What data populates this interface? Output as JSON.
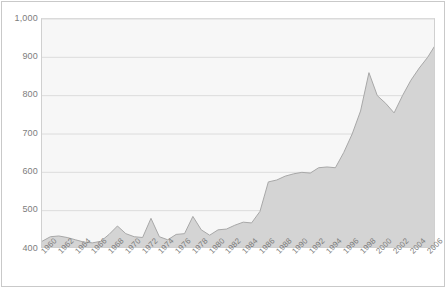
{
  "chart_data": {
    "type": "area",
    "title": "",
    "subtitle": "",
    "xlabel": "",
    "ylabel": "",
    "ylim": [
      400,
      1000
    ],
    "xlim": [
      1960,
      2007
    ],
    "grid": true,
    "legend": "none",
    "y_ticks": [
      "400",
      "500",
      "600",
      "700",
      "800",
      "900",
      "1,000"
    ],
    "y_tick_values": [
      400,
      500,
      600,
      700,
      800,
      900,
      1000
    ],
    "x_ticks": [
      "1960",
      "1962",
      "1964",
      "1966",
      "1968",
      "1970",
      "1972",
      "1974",
      "1976",
      "1978",
      "1980",
      "1982",
      "1984",
      "1986",
      "1988",
      "1990",
      "1992",
      "1994",
      "1996",
      "1998",
      "2000",
      "2002",
      "2004",
      "2006"
    ],
    "x_tick_values": [
      1960,
      1962,
      1964,
      1966,
      1968,
      1970,
      1972,
      1974,
      1976,
      1978,
      1980,
      1982,
      1984,
      1986,
      1988,
      1990,
      1992,
      1994,
      1996,
      1998,
      2000,
      2002,
      2004,
      2006
    ],
    "x": [
      1960,
      1961,
      1962,
      1963,
      1964,
      1965,
      1966,
      1967,
      1968,
      1969,
      1970,
      1971,
      1972,
      1973,
      1974,
      1975,
      1976,
      1977,
      1978,
      1979,
      1980,
      1981,
      1982,
      1983,
      1984,
      1985,
      1986,
      1987,
      1988,
      1989,
      1990,
      1991,
      1992,
      1993,
      1994,
      1995,
      1996,
      1997,
      1998,
      1999,
      2000,
      2001,
      2002,
      2003,
      2004,
      2005,
      2006,
      2007
    ],
    "values": [
      420,
      432,
      434,
      430,
      424,
      418,
      416,
      420,
      438,
      460,
      440,
      432,
      430,
      480,
      432,
      424,
      438,
      440,
      485,
      450,
      436,
      450,
      452,
      462,
      470,
      468,
      498,
      575,
      580,
      590,
      596,
      600,
      598,
      612,
      614,
      612,
      652,
      700,
      760,
      860,
      800,
      780,
      755,
      800,
      840,
      872,
      900,
      935
    ],
    "series": [
      {
        "name": "series-1",
        "fill_color": "#d4d4d4",
        "line_color": "#a8a8a8",
        "values": [
          420,
          432,
          434,
          430,
          424,
          418,
          416,
          420,
          438,
          460,
          440,
          432,
          430,
          480,
          432,
          424,
          438,
          440,
          485,
          450,
          436,
          450,
          452,
          462,
          470,
          468,
          498,
          575,
          580,
          590,
          596,
          600,
          598,
          612,
          614,
          612,
          652,
          700,
          760,
          860,
          800,
          780,
          755,
          800,
          840,
          872,
          900,
          935
        ]
      }
    ],
    "colors": {
      "fill": "#d4d4d4",
      "line": "#a8a8a8",
      "plot_background": "#f7f7f7",
      "gridline": "#dcdcdc",
      "frame": "#c9c9c9",
      "tick_label": "#7d7d7d"
    }
  }
}
